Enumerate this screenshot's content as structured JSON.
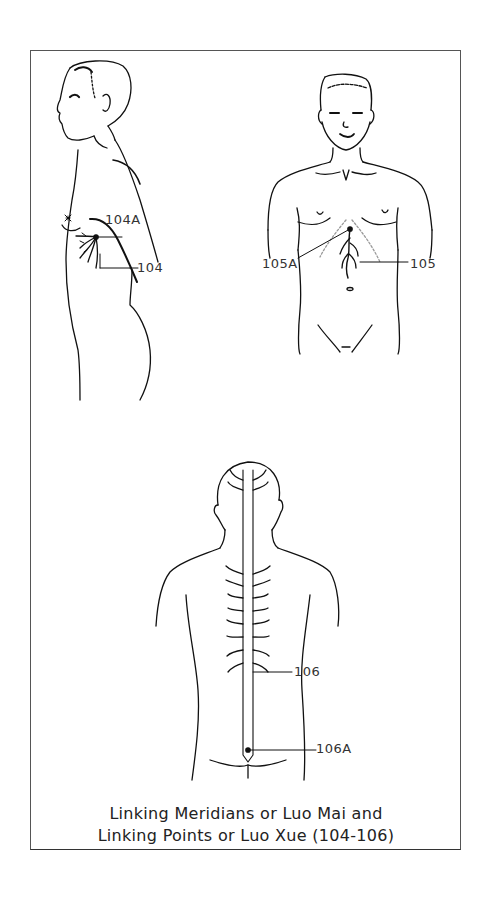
{
  "figure": {
    "labels": {
      "p104a": "104A",
      "p104": "104",
      "p105a": "105A",
      "p105": "105",
      "p106": "106",
      "p106a": "106A"
    },
    "caption": {
      "line1": "Linking Meridians or Luo Mai and",
      "line2": "Linking Points or Luo Xue (104-106)"
    },
    "figures": [
      {
        "view": "side",
        "points": [
          "104A",
          "104"
        ]
      },
      {
        "view": "front",
        "points": [
          "105A",
          "105"
        ]
      },
      {
        "view": "back",
        "points": [
          "106",
          "106A"
        ]
      }
    ]
  }
}
